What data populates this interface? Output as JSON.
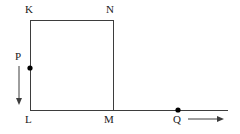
{
  "figure": {
    "type": "geometry-diagram",
    "canvas": {
      "width": 240,
      "height": 134,
      "background": "#ffffff"
    },
    "stroke_color": "#3d3d3d",
    "label_color": "#1a1a1a",
    "point_color": "#000000",
    "stroke_width": 1,
    "labels": [
      {
        "id": "K",
        "text": "K",
        "x": 25,
        "y": 4
      },
      {
        "id": "N",
        "text": "N",
        "x": 106,
        "y": 4
      },
      {
        "id": "P",
        "text": "P",
        "x": 15,
        "y": 51
      },
      {
        "id": "L",
        "text": "L",
        "x": 25,
        "y": 114
      },
      {
        "id": "M",
        "text": "M",
        "x": 104,
        "y": 114
      },
      {
        "id": "Q",
        "text": "Q",
        "x": 173,
        "y": 114
      }
    ],
    "vertices": {
      "K": {
        "x": 30,
        "y": 20
      },
      "N": {
        "x": 113,
        "y": 20
      },
      "L": {
        "x": 30,
        "y": 110
      },
      "M": {
        "x": 113,
        "y": 110
      }
    },
    "segments": [
      {
        "name": "top-edge-KN",
        "x1": 30,
        "y1": 20,
        "x2": 113,
        "y2": 20
      },
      {
        "name": "left-edge-KL",
        "x1": 30,
        "y1": 20,
        "x2": 30,
        "y2": 110
      },
      {
        "name": "right-edge-NM",
        "x1": 113,
        "y1": 20,
        "x2": 113,
        "y2": 110
      },
      {
        "name": "bottom-line-LM-extended",
        "x1": 30,
        "y1": 110,
        "x2": 228,
        "y2": 110
      }
    ],
    "points": [
      {
        "name": "point-P",
        "x": 30,
        "y": 68,
        "radius": 2.6
      },
      {
        "name": "point-Q",
        "x": 178,
        "y": 110,
        "radius": 2.6
      }
    ],
    "arrows": [
      {
        "name": "arrow-down-at-P",
        "direction": "down",
        "x1": 19,
        "y1": 66,
        "x2": 19,
        "y2": 104
      },
      {
        "name": "arrow-right-at-Q",
        "direction": "right",
        "x1": 188,
        "y1": 119,
        "x2": 223,
        "y2": 119
      }
    ]
  }
}
